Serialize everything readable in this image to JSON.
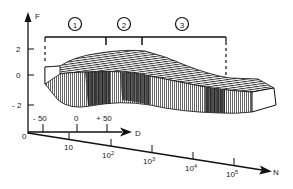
{
  "diagram": {
    "type": "3d-surface-illustration",
    "vertical_axis": {
      "label": "F",
      "ticks": [
        {
          "value": "2",
          "label": "2"
        },
        {
          "value": "0",
          "label": "0"
        },
        {
          "value": "-2",
          "label": "- 2"
        }
      ]
    },
    "depth_axis": {
      "label": "D",
      "ticks": [
        {
          "value": "-50",
          "label": "- 50"
        },
        {
          "value": "0",
          "label": "0"
        },
        {
          "value": "+50",
          "label": "+ 50"
        }
      ]
    },
    "horizontal_axis": {
      "label": "N",
      "scale": "logarithmic",
      "ticks": [
        {
          "base": "10",
          "exp": ""
        },
        {
          "base": "10",
          "exp": "2"
        },
        {
          "base": "10",
          "exp": "3"
        },
        {
          "base": "10",
          "exp": "4"
        },
        {
          "base": "10",
          "exp": "5"
        }
      ]
    },
    "origin_label": "0",
    "regions": [
      {
        "id": "1",
        "label": "1"
      },
      {
        "id": "2",
        "label": "2"
      },
      {
        "id": "3",
        "label": "3"
      }
    ]
  }
}
